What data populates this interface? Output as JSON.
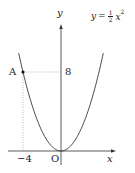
{
  "chart_data": {
    "type": "line",
    "title": "",
    "function": "y = 1/2 x^2",
    "curve_label": "y = ½x²",
    "xlabel": "x",
    "ylabel": "y",
    "origin_label": "O",
    "series": [
      {
        "name": "y = 1/2 x^2",
        "x": [
          -4.5,
          -4,
          -3,
          -2,
          -1,
          0,
          1,
          2,
          3,
          4,
          4.5
        ],
        "y": [
          10.125,
          8,
          4.5,
          2,
          0.5,
          0,
          0.5,
          2,
          4.5,
          8,
          10.125
        ]
      }
    ],
    "points": [
      {
        "label": "A",
        "x": -4,
        "y": 8
      }
    ],
    "tick_labels": {
      "x": [
        "-4"
      ],
      "y": [
        "8"
      ]
    },
    "guides": "dotted lines from A to x-axis (x=-4) and y-axis (y=8)",
    "grid": false
  },
  "labels": {
    "y_axis": "y",
    "x_axis": "x",
    "origin": "O",
    "point_a": "A",
    "y_tick": "8",
    "x_tick": "−4",
    "curve_lhs": "y",
    "curve_eq": "=",
    "curve_num": "1",
    "curve_den": "2",
    "curve_var": "x",
    "curve_exp": "2"
  }
}
